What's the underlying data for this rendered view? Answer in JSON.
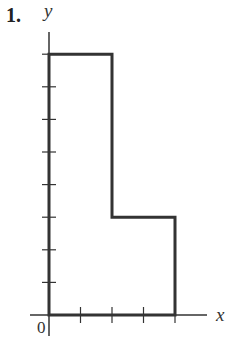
{
  "problem": {
    "number_label": "1."
  },
  "axes": {
    "x_label": "x",
    "y_label": "y",
    "origin_label": "0"
  },
  "colors": {
    "line": "#333333",
    "background": "#ffffff"
  },
  "chart_data": {
    "type": "diagram",
    "title": "1.",
    "xlabel": "x",
    "ylabel": "y",
    "x_ticks": [
      1,
      2,
      3,
      4
    ],
    "y_ticks": [
      1,
      2,
      3,
      4,
      5,
      6,
      7,
      8
    ],
    "tick_labels_shown": false,
    "xlim": [
      0,
      5
    ],
    "ylim": [
      0,
      8.7
    ],
    "shape": {
      "kind": "polygon",
      "description": "L-shaped region",
      "vertices": [
        [
          0,
          0
        ],
        [
          0,
          8
        ],
        [
          2,
          8
        ],
        [
          2,
          3
        ],
        [
          4,
          3
        ],
        [
          4,
          0
        ]
      ]
    }
  }
}
